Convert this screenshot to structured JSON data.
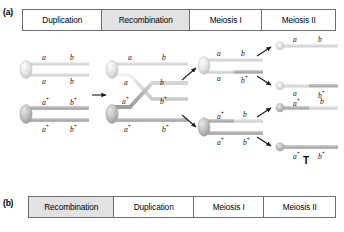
{
  "panels": {
    "a": {
      "label": "(a)"
    },
    "b": {
      "label": "(b)"
    }
  },
  "header_a": {
    "cells": [
      {
        "label": "Duplication",
        "shaded": false
      },
      {
        "label": "Recombination",
        "shaded": true
      },
      {
        "label": "Meiosis I",
        "shaded": false
      },
      {
        "label": "Meiosis II",
        "shaded": false
      }
    ]
  },
  "header_b": {
    "cells": [
      {
        "label": "Recombination",
        "shaded": true
      },
      {
        "label": "Duplication",
        "shaded": false
      },
      {
        "label": "Meiosis I",
        "shaded": false
      },
      {
        "label": "Meiosis II",
        "shaded": false
      }
    ]
  },
  "diagram": {
    "annotation_T": "T",
    "allele_a": "a",
    "allele_b": "b",
    "allele_a_plus": "a",
    "allele_b_plus": "b",
    "plus": "+",
    "duplication": {
      "chromosome_light": {
        "chromatid_top": {
          "left": "a",
          "right": "b"
        },
        "chromatid_bottom": {
          "left": "a",
          "right": "b"
        }
      },
      "chromosome_dark": {
        "chromatid_top": {
          "left": "a",
          "left_sup": "+",
          "right": "b",
          "right_sup": "+"
        },
        "chromatid_bottom": {
          "left": "a",
          "left_sup": "+",
          "right": "b",
          "right_sup": "+"
        }
      }
    },
    "recombination": {
      "chromosome_light": {
        "chromatid_top": {
          "left": "a",
          "right": "b"
        },
        "chromatid_bottom": {
          "left": "a",
          "right": "b"
        }
      },
      "chromosome_dark": {
        "chromatid_top": {
          "left": "a",
          "left_sup": "+",
          "right": "b",
          "right_sup": "+"
        },
        "chromatid_bottom": {
          "left": "a",
          "left_sup": "+",
          "right": "b",
          "right_sup": "+"
        }
      }
    },
    "meiosis_i": {
      "chromosome_top": {
        "chromatid_top": {
          "left": "a",
          "right": "b"
        },
        "chromatid_bottom": {
          "left": "a",
          "right": "b",
          "right_sup": "+"
        }
      },
      "chromosome_bottom": {
        "chromatid_top": {
          "left": "a",
          "left_sup": "+",
          "right": "b"
        },
        "chromatid_bottom": {
          "left": "a",
          "left_sup": "+",
          "right": "b",
          "right_sup": "+"
        }
      }
    },
    "meiosis_ii": {
      "chromatids": [
        {
          "left": "a",
          "left_sup": "",
          "right": "b",
          "right_sup": ""
        },
        {
          "left": "a",
          "left_sup": "",
          "right": "b",
          "right_sup": "+"
        },
        {
          "left": "a",
          "left_sup": "+",
          "right": "b",
          "right_sup": ""
        },
        {
          "left": "a",
          "left_sup": "+",
          "right": "b",
          "right_sup": "+"
        }
      ]
    }
  },
  "colors": {
    "light_chromatid": "#d9d9d9",
    "dark_chromatid": "#b0b0b0",
    "border": "#6e6e6e",
    "shaded_cell": "#e2e2e2",
    "arrow": "#1a1a1a"
  }
}
